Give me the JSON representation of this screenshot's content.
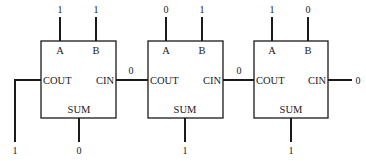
{
  "diagram": {
    "pin_labels": {
      "a": "A",
      "b": "B",
      "cout": "COUT",
      "cin": "CIN",
      "sum": "SUM"
    },
    "adders": [
      {
        "a": "1",
        "b": "1",
        "sum": "0",
        "cout_out": "1"
      },
      {
        "a": "0",
        "b": "1",
        "sum": "1",
        "carry_link": "0"
      },
      {
        "a": "1",
        "b": "0",
        "sum": "1",
        "carry_link": "0",
        "cin_in": "0"
      }
    ]
  }
}
